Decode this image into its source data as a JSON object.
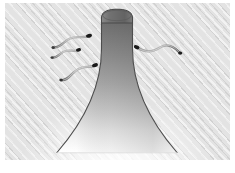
{
  "figure": {
    "caption": "",
    "background_color": "#e3e3e3",
    "margin_color": "#ffffff",
    "panel": {
      "x": 5,
      "y": 3,
      "width": 225,
      "height": 157,
      "texture": "diagonal-hatch"
    }
  },
  "plume": {
    "label": "chemoattractant-plume",
    "description": "Vertical tower flaring outward at its base, rounded cap at top",
    "outline_color": "#4d4d4d",
    "fill_top_color": "#6e6e6e",
    "fill_mid_color": "#a9a9a9",
    "fill_bottom_color": "#ffffff",
    "cap": {
      "cx": 112,
      "cy": 14,
      "rx": 17,
      "ry": 6
    },
    "apex_y": 8,
    "base_y": 150,
    "base_left_x": 52,
    "base_right_x": 172,
    "neck_left_x": 95,
    "neck_right_x": 129
  },
  "cells": [
    {
      "id": "cell-1",
      "label": "sperm-cell-upper-left",
      "head_x": 84,
      "head_y": 33,
      "tail_end_x": 48,
      "tail_end_y": 44,
      "head_color": "#1a1a1a",
      "tail_color": "#8c8c8c",
      "direction": "right"
    },
    {
      "id": "cell-2",
      "label": "sperm-cell-middle-left",
      "head_x": 73,
      "head_y": 47,
      "tail_end_x": 47,
      "tail_end_y": 54,
      "head_color": "#1a1a1a",
      "tail_color": "#8c8c8c",
      "direction": "right"
    },
    {
      "id": "cell-3",
      "label": "sperm-cell-lower-left",
      "head_x": 90,
      "head_y": 62,
      "tail_end_x": 56,
      "tail_end_y": 77,
      "head_color": "#1a1a1a",
      "tail_color": "#8c8c8c",
      "direction": "right"
    },
    {
      "id": "cell-4",
      "label": "sperm-cell-right",
      "head_x": 131,
      "head_y": 45,
      "tail_end_x": 176,
      "tail_end_y": 50,
      "head_color": "#1a1a1a",
      "tail_color": "#8c8c8c",
      "direction": "left"
    }
  ],
  "colors": {
    "panel": "#e3e3e3",
    "outline": "#4d4d4d",
    "cell_head": "#1a1a1a",
    "cell_tail": "#8c8c8c",
    "white": "#ffffff"
  }
}
